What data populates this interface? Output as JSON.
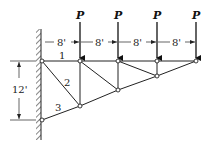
{
  "diagram": {
    "type": "cantilever-truss",
    "loads": [
      {
        "label": "P",
        "x": 80
      },
      {
        "label": "P",
        "x": 118
      },
      {
        "label": "P",
        "x": 157
      },
      {
        "label": "P",
        "x": 196
      }
    ],
    "horizontal_dimensions": [
      "8'",
      "8'",
      "8'",
      "8'"
    ],
    "vertical_dimension": "12'",
    "member_labels": [
      "1",
      "2",
      "3"
    ],
    "colors": {
      "line": "#222222",
      "background": "#ffffff"
    }
  }
}
